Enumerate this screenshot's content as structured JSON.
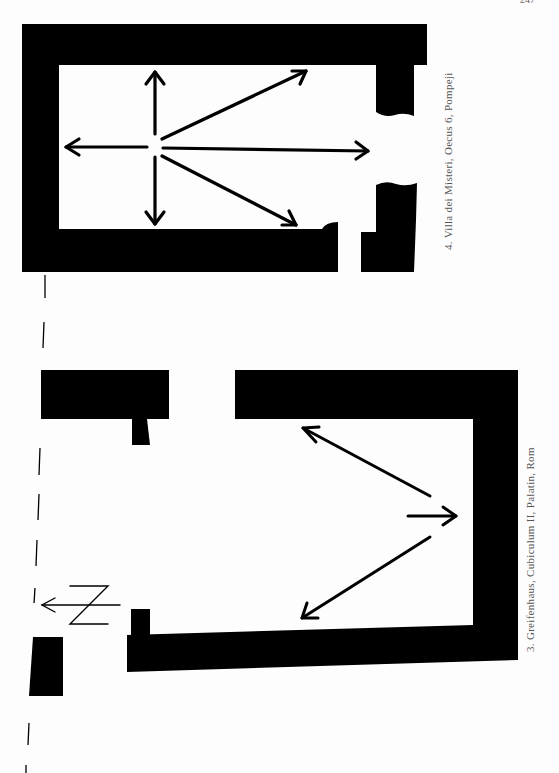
{
  "page": {
    "page_number": "247",
    "background": "#fdfdfd",
    "ink_color": "#000000"
  },
  "figures": [
    {
      "number": "4",
      "caption": "4. Villa dei Misteri, Oecus 6, Pompeji",
      "type": "floor-plan",
      "arrows": [
        "up",
        "down",
        "left",
        "right",
        "upper-right",
        "lower-right"
      ]
    },
    {
      "number": "3",
      "caption": "3. Greifenhaus, Cubiculum II, Palatin, Rom",
      "type": "floor-plan",
      "arrows": [
        "upper-left",
        "right",
        "lower-left"
      ],
      "north_arrow": "N"
    }
  ]
}
